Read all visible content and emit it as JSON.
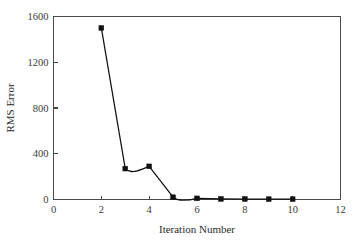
{
  "chart_data": {
    "type": "line",
    "title": "",
    "xlabel": "Iteration Number",
    "ylabel": "RMS Error",
    "xlim": [
      0,
      12
    ],
    "ylim": [
      0,
      1600
    ],
    "xticks": [
      0,
      2,
      4,
      6,
      8,
      10,
      12
    ],
    "yticks": [
      0,
      400,
      800,
      1200,
      1600
    ],
    "xtick_labels": [
      "0",
      "2",
      "4",
      "6",
      "8",
      "10",
      "12"
    ],
    "ytick_labels": [
      "0",
      "400",
      "800",
      "1200",
      "1600"
    ],
    "grid": false,
    "legend": false,
    "marker": "square",
    "line_color": "#111111",
    "marker_color": "#111111",
    "axis_color": "#4a4a4a",
    "background_color": "#ffffff",
    "x": [
      2,
      3,
      4,
      5,
      6,
      7,
      8,
      9,
      10
    ],
    "values": [
      1500,
      270,
      290,
      20,
      10,
      5,
      4,
      3,
      3
    ],
    "series": [
      {
        "name": "RMS Error",
        "x": [
          2,
          3,
          4,
          5,
          6,
          7,
          8,
          9,
          10
        ],
        "values": [
          1500,
          270,
          290,
          20,
          10,
          5,
          4,
          3,
          3
        ]
      }
    ]
  }
}
